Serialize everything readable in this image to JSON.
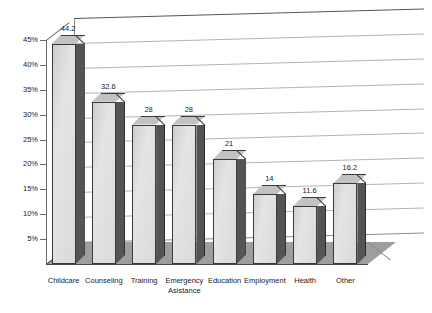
{
  "chart_data": {
    "type": "bar",
    "title": "",
    "subtitle": "",
    "xlabel": "",
    "ylabel": "",
    "categories": [
      "Childcare",
      "Counseling",
      "Training",
      "Emergency Asistance",
      "Education",
      "Employment",
      "Health",
      "Other"
    ],
    "values": [
      44.2,
      32.6,
      28,
      28,
      21,
      14,
      11.6,
      16.2
    ],
    "value_labels": [
      "44.2",
      "32.6",
      "28",
      "28",
      "21",
      "14",
      "11.6",
      "16.2"
    ],
    "ylim": [
      0,
      45
    ],
    "ytick_values": [
      5,
      10,
      15,
      20,
      25,
      30,
      35,
      40,
      45
    ],
    "ytick_labels": [
      "5%",
      "10%",
      "15%",
      "20%",
      "25%",
      "30%",
      "35%",
      "40%",
      "45%"
    ],
    "grid": true,
    "grid_axis": "y",
    "legend": false,
    "legend_position": "none",
    "style": "3d-column",
    "colors": {
      "bar_front": "#dcdcdc",
      "bar_side": "#545454",
      "bar_top": "#c2c2c2",
      "bar_outline": "#3a3a3a",
      "floor": "#9e9e9e",
      "gridline": "#b4b4b4",
      "axis": "#6b6b6b",
      "text": "#1a1a1a",
      "background": "#ffffff"
    }
  }
}
